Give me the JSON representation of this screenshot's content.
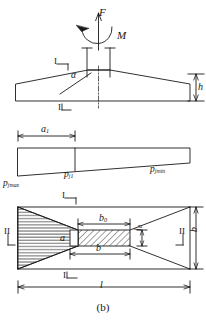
{
  "figure": {
    "caption": "(b)",
    "stroke_color": "#1a1a1a",
    "background": "#ffffff"
  },
  "elevation": {
    "name": "footing-elevation-view",
    "load_vertical": "F",
    "load_moment": "M",
    "angle_label": "α",
    "height_label": "h",
    "section_mark_top": "I",
    "section_mark_bottom": "I"
  },
  "pressure": {
    "name": "soil-pressure-diagram",
    "dim_a1": "a",
    "dim_a1_sub": "1",
    "p_max": "p",
    "p_max_sub": "jmax",
    "p_mid": "p",
    "p_mid_sub": "j1",
    "p_min": "p",
    "p_min_sub": "jmin"
  },
  "plan": {
    "name": "footing-plan-view",
    "dim_b0": "b",
    "dim_b0_sub": "0",
    "dim_l0": "l",
    "dim_l0_sub": "0",
    "dim_b_bottom": "b",
    "dim_a": "a",
    "dim_b_right": "b",
    "dim_l": "l",
    "section_I_top": "I",
    "section_I_bottom": "I",
    "section_II_left": "II",
    "section_II_right": "II"
  }
}
